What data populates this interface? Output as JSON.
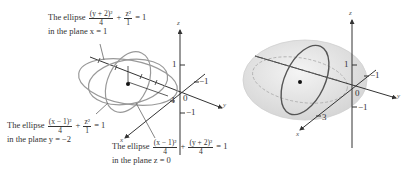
{
  "left_figure": {
    "label_top": {
      "prefix": "The ellipse",
      "frac1_num": "(y + 2)²",
      "frac1_den": "4",
      "plus": "+",
      "frac2_num": "z²",
      "frac2_den": "1",
      "rhs": "= 1",
      "line2": "in the plane x = 1"
    },
    "label_left": {
      "prefix": "The ellipse",
      "frac1_num": "(x − 1)²",
      "frac1_den": "4",
      "plus": "+",
      "frac2_num": "z²",
      "frac2_den": "1",
      "rhs": "= 1",
      "line2": "in the plane y = −2"
    },
    "label_bottom": {
      "prefix": "The ellipse",
      "frac1_num": "(x − 1)²",
      "frac1_den": "4",
      "plus": "+",
      "frac2_num": "(y + 2)²",
      "frac2_den": "4",
      "rhs": "= 1",
      "line2": "in the plane z = 0"
    },
    "axes": {
      "x": "x",
      "y": "y",
      "z": "z"
    },
    "ticks": {
      "z_pos": "1",
      "z_neg": "−1",
      "y_neg": "−1",
      "origin": "0",
      "x_pos": "1"
    }
  },
  "right_figure": {
    "axes": {
      "x": "x",
      "y": "y",
      "z": "z"
    },
    "ticks": {
      "z_pos": "1",
      "z_neg": "−1",
      "y_neg": "−1",
      "origin": "0",
      "x_pos": "3"
    }
  }
}
